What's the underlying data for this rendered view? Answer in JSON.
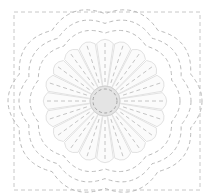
{
  "pattern": {
    "name": "quilt-block-flower",
    "canvas": {
      "width": 210,
      "height": 196
    },
    "center": {
      "x": 105,
      "y": 101
    },
    "border": {
      "x": 14,
      "y": 12,
      "width": 186,
      "height": 178,
      "style": "dashed"
    },
    "center_disc": {
      "radius": 15,
      "color": "#e4e4e4"
    },
    "petals": {
      "count": 20,
      "inner_radius": 15,
      "outer_radius": 64,
      "fill": "#fbfbfb",
      "outline": "#e2e2e2"
    },
    "scallop_rings": [
      {
        "radius": 70,
        "lobes": 10,
        "amplitude": 5
      },
      {
        "radius": 80,
        "lobes": 10,
        "amplitude": 6
      },
      {
        "radius": 90,
        "lobes": 10,
        "amplitude": 7
      }
    ],
    "stitch_color": "#b9b9b9"
  }
}
